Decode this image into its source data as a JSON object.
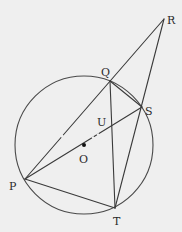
{
  "diagram": {
    "circle": {
      "center": "O",
      "cx": 84,
      "cy": 145,
      "r": 69
    },
    "points": {
      "P": {
        "label": "P",
        "x": 25,
        "y": 179,
        "lx": 9,
        "ly": 190
      },
      "Q": {
        "label": "Q",
        "x": 110,
        "y": 81,
        "lx": 101,
        "ly": 76
      },
      "R": {
        "label": "R",
        "x": 164,
        "y": 19,
        "lx": 167,
        "ly": 24
      },
      "S": {
        "label": "S",
        "x": 142,
        "y": 107,
        "lx": 145,
        "ly": 115
      },
      "T": {
        "label": "T",
        "x": 115,
        "y": 208,
        "lx": 113,
        "ly": 225
      },
      "U": {
        "label": "U",
        "x": 111,
        "y": 127,
        "lx": 97,
        "ly": 126
      },
      "O": {
        "label": "O",
        "x": 84,
        "y": 145,
        "lx": 79,
        "ly": 163
      }
    },
    "segments": [
      {
        "name": "PR",
        "from": "P",
        "to": "R"
      },
      {
        "name": "PS",
        "from": "P",
        "to": "S"
      },
      {
        "name": "PT",
        "from": "P",
        "to": "T"
      },
      {
        "name": "QT",
        "from": "Q",
        "to": "T"
      },
      {
        "name": "QS",
        "from": "Q",
        "to": "S"
      },
      {
        "name": "RT",
        "from": "R",
        "to": "T"
      }
    ],
    "colors": {
      "background": "#efefef",
      "stroke": "#3a3a3a",
      "text": "#2a2a2a"
    }
  }
}
